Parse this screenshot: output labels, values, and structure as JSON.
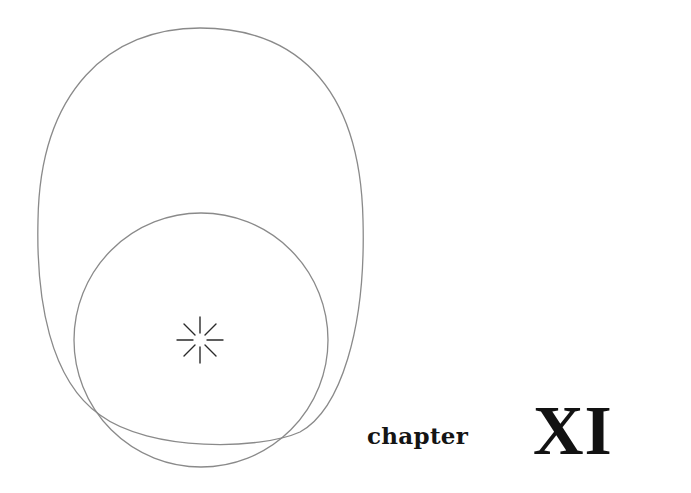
{
  "chapter_opener": {
    "label": "chapter",
    "number": "XI"
  },
  "illustration": {
    "line_color": "#8a8a8a",
    "burst_color": "#2a2a2a",
    "shapes": [
      "outer-oval",
      "inner-circle",
      "radiating-burst"
    ]
  }
}
